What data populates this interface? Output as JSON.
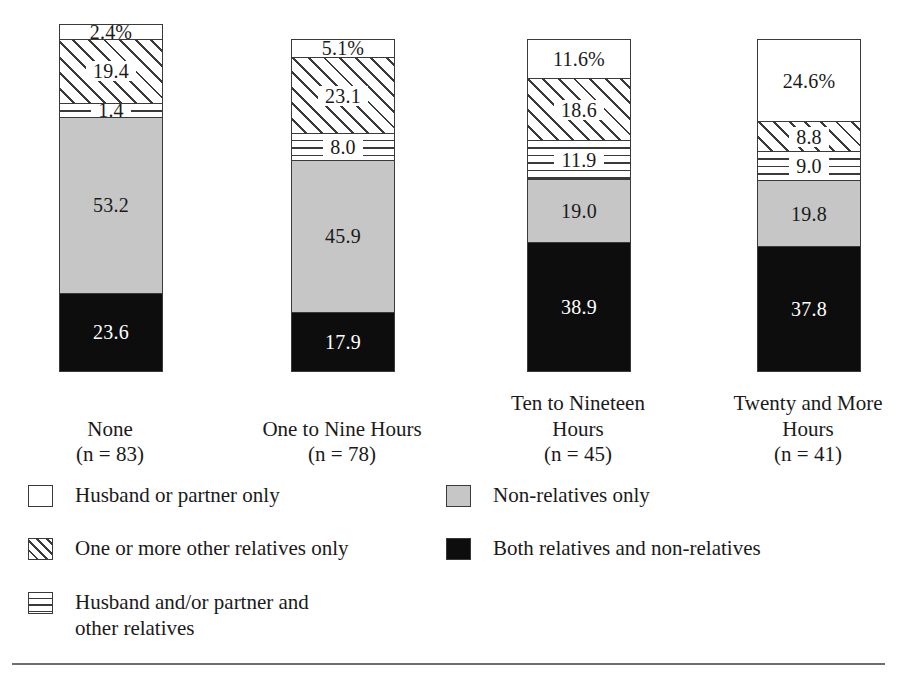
{
  "chart_data": {
    "type": "bar",
    "subtype": "stacked-percentage",
    "title": "",
    "xlabel": "",
    "ylabel": "",
    "ylim": [
      0,
      100
    ],
    "grid": false,
    "legend_position": "bottom",
    "categories": [
      "None",
      "One to Nine Hours",
      "Ten to Nineteen Hours",
      "Twenty and More Hours"
    ],
    "category_counts": [
      "(n = 83)",
      "(n = 78)",
      "(n = 45)",
      "(n = 41)"
    ],
    "series": [
      {
        "name": "Husband or partner only",
        "fill": "white",
        "values": [
          2.4,
          5.1,
          11.6,
          24.6
        ],
        "labels": [
          "2.4%",
          "5.1%",
          "11.6%",
          "24.6%"
        ]
      },
      {
        "name": "One or more other relatives only",
        "fill": "diagonal-hatch",
        "values": [
          19.4,
          23.1,
          18.6,
          8.8
        ],
        "labels": [
          "19.4",
          "23.1",
          "18.6",
          "8.8"
        ]
      },
      {
        "name": "Husband and/or partner and other relatives",
        "fill": "horizontal-hatch",
        "values": [
          1.4,
          8.0,
          11.9,
          9.0
        ],
        "labels": [
          "1.4",
          "8.0",
          "11.9",
          "9.0"
        ]
      },
      {
        "name": "Non-relatives only",
        "fill": "gray",
        "values": [
          53.2,
          45.9,
          19.0,
          19.8
        ],
        "labels": [
          "53.2",
          "45.9",
          "19.0",
          "19.8"
        ]
      },
      {
        "name": "Both relatives and non-relatives",
        "fill": "black",
        "values": [
          23.6,
          17.9,
          38.9,
          37.8
        ],
        "labels": [
          "23.6",
          "17.9",
          "38.9",
          "37.8"
        ]
      }
    ]
  },
  "bars": [
    {
      "category_label": "None",
      "count_label": "(n = 83)",
      "segments": [
        {
          "label": "2.4%",
          "value": 2.4,
          "fill": "white"
        },
        {
          "label": "19.4",
          "value": 19.4,
          "fill": "diagonal-hatch"
        },
        {
          "label": "1.4",
          "value": 1.4,
          "fill": "horizontal-hatch"
        },
        {
          "label": "53.2",
          "value": 53.2,
          "fill": "gray"
        },
        {
          "label": "23.6",
          "value": 23.6,
          "fill": "black"
        }
      ]
    },
    {
      "category_label": "One to Nine Hours",
      "count_label": "(n = 78)",
      "segments": [
        {
          "label": "5.1%",
          "value": 5.1,
          "fill": "white"
        },
        {
          "label": "23.1",
          "value": 23.1,
          "fill": "diagonal-hatch"
        },
        {
          "label": "8.0",
          "value": 8.0,
          "fill": "horizontal-hatch"
        },
        {
          "label": "45.9",
          "value": 45.9,
          "fill": "gray"
        },
        {
          "label": "17.9",
          "value": 17.9,
          "fill": "black"
        }
      ]
    },
    {
      "category_label": "Ten to Nineteen Hours",
      "count_label": "(n = 45)",
      "segments": [
        {
          "label": "11.6%",
          "value": 11.6,
          "fill": "white"
        },
        {
          "label": "18.6",
          "value": 18.6,
          "fill": "diagonal-hatch"
        },
        {
          "label": "11.9",
          "value": 11.9,
          "fill": "horizontal-hatch"
        },
        {
          "label": "19.0",
          "value": 19.0,
          "fill": "gray"
        },
        {
          "label": "38.9",
          "value": 38.9,
          "fill": "black"
        }
      ]
    },
    {
      "category_label": "Twenty and More Hours",
      "count_label": "(n = 41)",
      "segments": [
        {
          "label": "24.6%",
          "value": 24.6,
          "fill": "white"
        },
        {
          "label": "8.8",
          "value": 8.8,
          "fill": "diagonal-hatch"
        },
        {
          "label": "9.0",
          "value": 9.0,
          "fill": "horizontal-hatch"
        },
        {
          "label": "19.8",
          "value": 19.8,
          "fill": "gray"
        },
        {
          "label": "37.8",
          "value": 37.8,
          "fill": "black"
        }
      ]
    }
  ],
  "legend": {
    "left_items": [
      {
        "swatch": "white",
        "text": "Husband or partner only"
      },
      {
        "swatch": "diagonal-hatch",
        "text": "One or more other relatives only"
      },
      {
        "swatch": "horizontal-hatch",
        "text": "Husband and/or partner and\nother relatives"
      }
    ],
    "right_items": [
      {
        "swatch": "gray",
        "text": "Non-relatives only"
      },
      {
        "swatch": "black",
        "text": "Both relatives and non-relatives"
      }
    ]
  },
  "colors": {
    "white": "#ffffff",
    "gray": "#c6c6c6",
    "black": "#0d0d0d",
    "outline": "#3a3a3a",
    "rule": "#6e6e6e",
    "text": "#1a1a1a"
  }
}
